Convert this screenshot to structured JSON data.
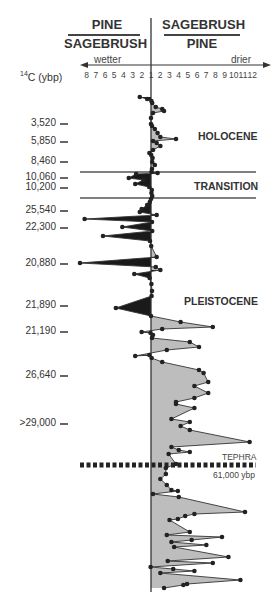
{
  "chart_data": {
    "type": "area",
    "title": "",
    "header": {
      "left_numerator": "PINE",
      "left_denominator": "SAGEBRUSH",
      "right_numerator": "SAGEBRUSH",
      "right_denominator": "PINE"
    },
    "x_axis": {
      "left_label": "wetter",
      "right_label": "drier",
      "left_ticks": [
        "8",
        "7",
        "6",
        "5",
        "4",
        "3",
        "2"
      ],
      "center_tick": "1",
      "right_ticks": [
        "2",
        "3",
        "4",
        "5",
        "6",
        "7",
        "8",
        "9",
        "10",
        "11",
        "12"
      ]
    },
    "y_axis": {
      "label": "14C (ybp)",
      "label_sup": "14",
      "label_rest": "C (ybp)",
      "ticks": [
        {
          "label": "3,520",
          "y": 124
        },
        {
          "label": "5,850",
          "y": 142
        },
        {
          "label": "8,460",
          "y": 162
        },
        {
          "label": "10,060",
          "y": 178
        },
        {
          "label": "10,200",
          "y": 188
        },
        {
          "label": "25,540",
          "y": 211
        },
        {
          "label": "22,300",
          "y": 228
        },
        {
          "label": "20,880",
          "y": 264
        },
        {
          "label": "21,890",
          "y": 306
        },
        {
          "label": "21,190",
          "y": 332
        },
        {
          "label": "26,640",
          "y": 376
        },
        {
          "label": ">29,000",
          "y": 424
        }
      ]
    },
    "zones": [
      {
        "label": "HOLOCENE",
        "y": 136
      },
      {
        "label": "TRANSITION",
        "y": 186
      },
      {
        "label": "PLEISTOCENE",
        "y": 301
      }
    ],
    "boundaries_y": [
      172,
      198
    ],
    "tephra": {
      "label": "TEPHRA",
      "date": "61,000 ybp",
      "y": 465
    },
    "legend_colors": {
      "pine_dominant": "#1a1a1a",
      "sagebrush_dominant": "#bdbdbd",
      "line": "#333333"
    },
    "series": [
      {
        "name": "pollen ratio (negative = pine/sagebrush, positive = sagebrush/pine)",
        "points": [
          [
            -2.0,
            97
          ],
          [
            -1.2,
            99
          ],
          [
            0.2,
            101
          ],
          [
            0.6,
            103
          ],
          [
            1.3,
            107
          ],
          [
            2.0,
            109
          ],
          [
            2.2,
            111
          ],
          [
            1.0,
            113
          ],
          [
            0,
            118
          ],
          [
            0,
            124
          ],
          [
            0.5,
            126
          ],
          [
            1.2,
            129
          ],
          [
            1.5,
            133
          ],
          [
            1.8,
            137
          ],
          [
            3.5,
            139
          ],
          [
            1.0,
            141
          ],
          [
            1.4,
            143
          ],
          [
            1.8,
            146
          ],
          [
            1.0,
            150
          ],
          [
            -0.8,
            153
          ],
          [
            0.1,
            155
          ],
          [
            0.8,
            158
          ],
          [
            0.6,
            162
          ],
          [
            1.2,
            165
          ],
          [
            0.5,
            169
          ],
          [
            0.2,
            172
          ],
          [
            1.5,
            173
          ],
          [
            -2.4,
            174
          ],
          [
            -3.2,
            178
          ],
          [
            -1.6,
            180
          ],
          [
            -2.5,
            184
          ],
          [
            -0.9,
            187
          ],
          [
            0.4,
            190
          ],
          [
            0.2,
            193
          ],
          [
            0.6,
            196
          ],
          [
            0,
            199
          ],
          [
            -0.6,
            202
          ],
          [
            -1.2,
            205
          ],
          [
            -1.8,
            209
          ],
          [
            -2.0,
            212
          ],
          [
            1.4,
            215
          ],
          [
            -8.0,
            219
          ],
          [
            0.5,
            222
          ],
          [
            -3.9,
            227
          ],
          [
            0.6,
            231
          ],
          [
            -6.0,
            236
          ],
          [
            -0.5,
            241
          ],
          [
            0.1,
            246
          ],
          [
            1.4,
            257
          ],
          [
            -8.5,
            263
          ],
          [
            1.3,
            267
          ],
          [
            1.8,
            270
          ],
          [
            -2.6,
            274
          ],
          [
            -0.7,
            278
          ],
          [
            0.2,
            284
          ],
          [
            0.5,
            291
          ],
          [
            0.3,
            296
          ],
          [
            -4.6,
            308
          ],
          [
            0.0,
            316
          ],
          [
            4.0,
            322
          ],
          [
            7.5,
            327
          ],
          [
            2.0,
            329
          ],
          [
            -1.8,
            332
          ],
          [
            -0.2,
            333
          ],
          [
            1.0,
            335
          ],
          [
            0.5,
            338
          ],
          [
            5.0,
            342
          ],
          [
            6.0,
            347
          ],
          [
            2.5,
            350
          ],
          [
            -2.5,
            356
          ],
          [
            -0.8,
            355
          ],
          [
            0.3,
            358
          ],
          [
            2.0,
            362
          ],
          [
            6.0,
            370
          ],
          [
            6.5,
            373
          ],
          [
            7.0,
            382
          ],
          [
            5.5,
            386
          ],
          [
            7.0,
            393
          ],
          [
            5.5,
            398
          ],
          [
            3.5,
            402
          ],
          [
            3.5,
            404
          ],
          [
            5.5,
            408
          ],
          [
            3.0,
            419
          ],
          [
            5.0,
            422
          ],
          [
            4.0,
            426
          ],
          [
            5.0,
            430
          ],
          [
            11.5,
            442
          ],
          [
            3.0,
            447
          ],
          [
            3.8,
            450
          ],
          [
            5.0,
            452
          ],
          [
            2.7,
            454
          ],
          [
            3.5,
            464
          ],
          [
            2.4,
            468
          ],
          [
            2.4,
            474
          ],
          [
            1.8,
            479
          ],
          [
            2.5,
            485
          ],
          [
            3.0,
            490
          ],
          [
            3.7,
            491
          ],
          [
            1.0,
            494
          ],
          [
            3.8,
            497
          ],
          [
            11.0,
            512
          ],
          [
            5.5,
            514
          ],
          [
            4.5,
            516
          ],
          [
            3.7,
            519
          ],
          [
            2.8,
            520
          ],
          [
            5.0,
            532
          ],
          [
            2.5,
            535
          ],
          [
            8.5,
            537
          ],
          [
            5.2,
            540
          ],
          [
            3.0,
            542
          ],
          [
            6.8,
            545
          ],
          [
            3.3,
            547
          ],
          [
            9.2,
            557
          ],
          [
            2.6,
            561
          ],
          [
            7.5,
            563
          ],
          [
            -0.2,
            567
          ],
          [
            3.2,
            569
          ],
          [
            5.5,
            571
          ],
          [
            1.8,
            573
          ],
          [
            10.5,
            580
          ],
          [
            4.7,
            584
          ],
          [
            4.3,
            585
          ],
          [
            2.2,
            588
          ]
        ]
      }
    ]
  }
}
